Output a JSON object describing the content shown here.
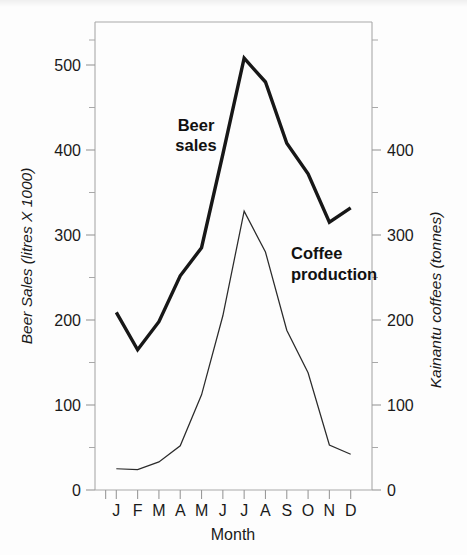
{
  "chart_data": {
    "type": "line",
    "title": "",
    "xlabel": "Month",
    "categories": [
      "J",
      "F",
      "M",
      "A",
      "M",
      "J",
      "J",
      "A",
      "S",
      "O",
      "N",
      "D"
    ],
    "month_names": [
      "January",
      "February",
      "March",
      "April",
      "May",
      "June",
      "July",
      "August",
      "September",
      "October",
      "November",
      "December"
    ],
    "grid": false,
    "legend_position": "inline-annotations",
    "axes": {
      "left": {
        "label": "Beer Sales (litres X 1000)",
        "ticks": [
          0,
          100,
          200,
          300,
          400,
          500
        ],
        "tick_labels": [
          "0",
          "100",
          "200",
          "300",
          "400",
          "500"
        ],
        "minor_tick_interval": 50,
        "range": [
          0,
          555
        ]
      },
      "right": {
        "label": "Kainantu coffees (tonnes)",
        "ticks": [
          0,
          100,
          200,
          300,
          400
        ],
        "tick_labels": [
          "0",
          "100",
          "200",
          "300",
          "400"
        ],
        "minor_tick_interval": 50,
        "range": [
          0,
          555
        ]
      }
    },
    "series": [
      {
        "name": "Beer sales",
        "annotation": "Beer\nsales",
        "annotation_line1": "Beer",
        "annotation_line2": "sales",
        "axis": "left",
        "unit": "litres X 1000",
        "stroke": "#171717",
        "values": [
          209,
          165,
          198,
          252,
          285,
          395,
          508,
          480,
          408,
          372,
          315,
          332
        ]
      },
      {
        "name": "Coffee production",
        "annotation": "Coffee\nproduction",
        "annotation_line1": "Coffee",
        "annotation_line2": "production",
        "axis": "right",
        "unit": "tonnes",
        "stroke": "#2b2b2b",
        "values": [
          25,
          24,
          33,
          52,
          112,
          205,
          328,
          280,
          188,
          138,
          53,
          42
        ]
      }
    ]
  },
  "annotations": {
    "beer": {
      "line1": "Beer",
      "line2": "sales"
    },
    "coffee": {
      "line1": "Coffee",
      "line2": "production"
    }
  },
  "colors": {
    "beer_line": "#171717",
    "coffee_line": "#2b2b2b",
    "frame": "#a9a9a9",
    "text": "#1a1a1a",
    "background": "#fdfdfd"
  }
}
